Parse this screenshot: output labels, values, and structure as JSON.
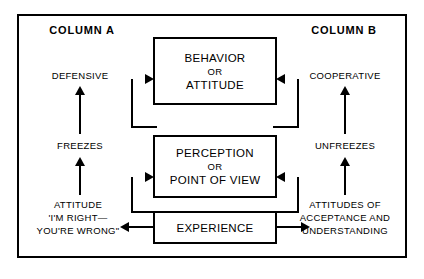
{
  "diagram": {
    "columns": {
      "a_heading": "COLUMN A",
      "b_heading": "COLUMN B"
    },
    "center_boxes": [
      {
        "id": "behavior",
        "lines": [
          "BEHAVIOR",
          "OR",
          "ATTITUDE"
        ]
      },
      {
        "id": "perception",
        "lines": [
          "PERCEPTION",
          "OR",
          "POINT OF VIEW"
        ]
      },
      {
        "id": "experience",
        "lines": [
          "EXPERIENCE"
        ]
      }
    ],
    "column_a": {
      "defensive": "DEFENSIVE",
      "freezes": "FREEZES",
      "attitude_line1": "ATTITUDE",
      "attitude_line2": "'I'M RIGHT—",
      "attitude_line3": "YOU'RE WRONG\""
    },
    "column_b": {
      "cooperative": "COOPERATIVE",
      "unfreezes": "UNFREEZES",
      "attitudes_line1": "ATTITUDES OF",
      "attitudes_line2": "ACCEPTANCE AND",
      "attitudes_line3": "UNDERSTANDING"
    },
    "colors": {
      "ink": "#000000",
      "background": "#ffffff"
    }
  }
}
